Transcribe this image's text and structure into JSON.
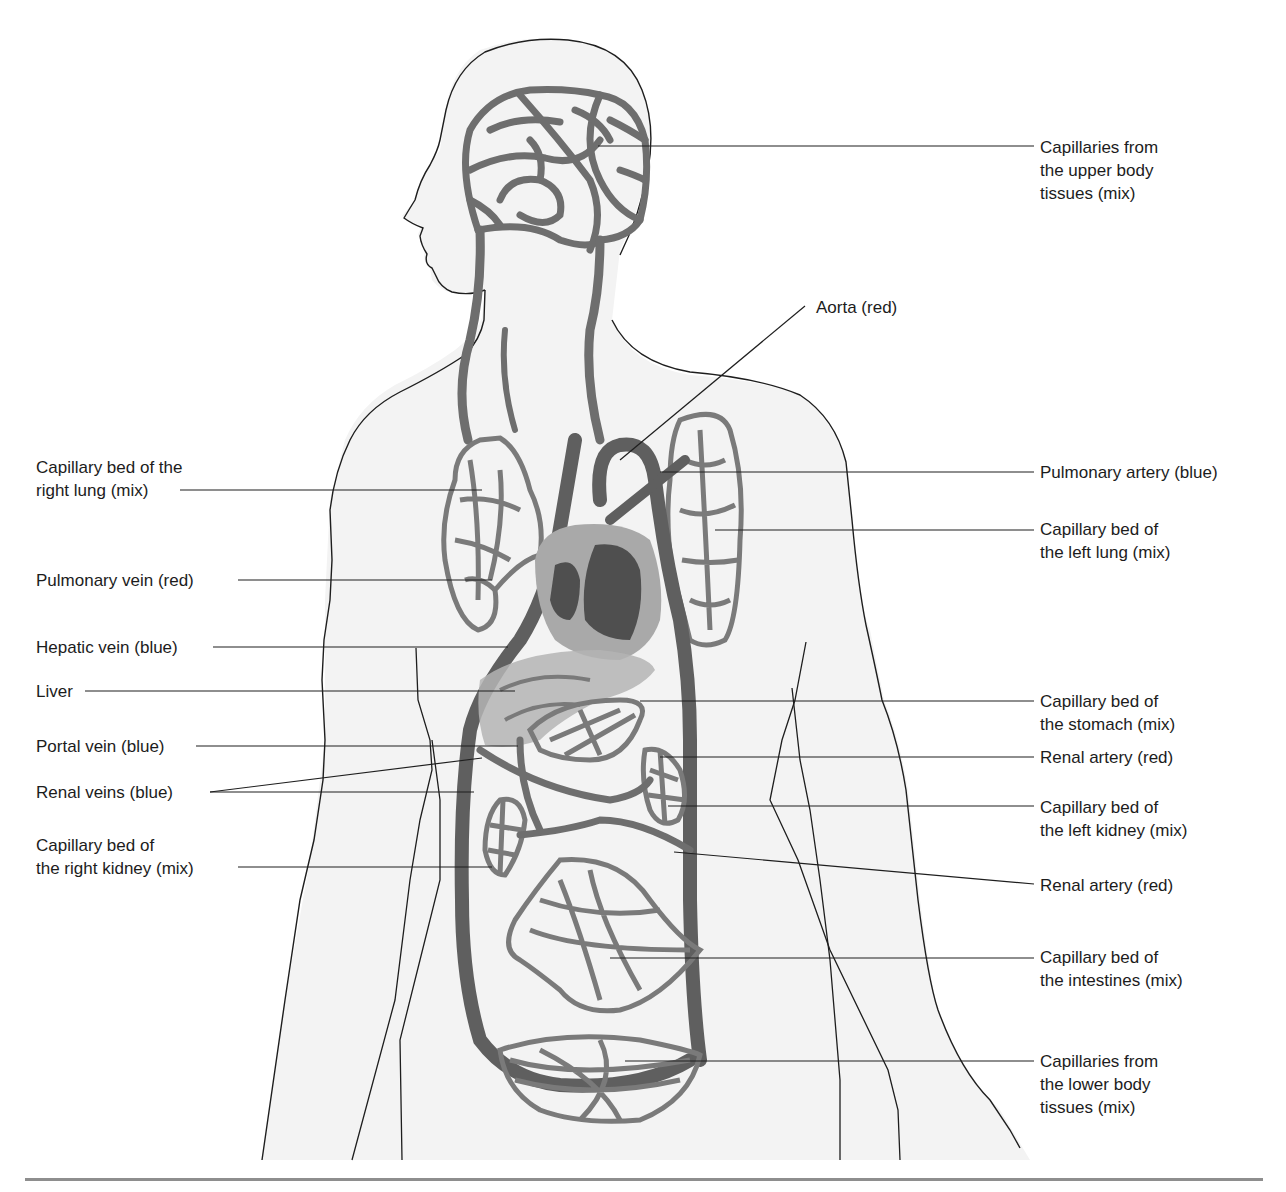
{
  "diagram": {
    "colors": {
      "body_fill": "#f3f3f3",
      "outline": "#1e1e1e",
      "vessel": "#6e6e6e",
      "vessel_dark": "#5a5a5a",
      "heart_outer": "#a9a9a9",
      "heart_inner": "#4f4f4f",
      "liver": "#b4b4b4",
      "leader": "#1e1e1e",
      "footer_rule": "#8e8e8e"
    },
    "labels_left": [
      {
        "id": "capillary-bed-right-lung",
        "text": "Capillary bed of the\nright lung (mix)"
      },
      {
        "id": "pulmonary-vein",
        "text": "Pulmonary vein (red)"
      },
      {
        "id": "hepatic-vein",
        "text": "Hepatic vein (blue)"
      },
      {
        "id": "liver",
        "text": "Liver"
      },
      {
        "id": "portal-vein",
        "text": "Portal vein (blue)"
      },
      {
        "id": "renal-veins",
        "text": "Renal veins (blue)"
      },
      {
        "id": "capillary-bed-right-kidney",
        "text": "Capillary bed of\nthe right kidney (mix)"
      }
    ],
    "labels_right": [
      {
        "id": "capillaries-upper-body",
        "text": "Capillaries from\nthe upper body\ntissues (mix)"
      },
      {
        "id": "aorta",
        "text": "Aorta (red)"
      },
      {
        "id": "pulmonary-artery",
        "text": "Pulmonary artery (blue)"
      },
      {
        "id": "capillary-bed-left-lung",
        "text": "Capillary bed of\nthe left lung (mix)"
      },
      {
        "id": "capillary-bed-stomach",
        "text": "Capillary bed of\nthe stomach (mix)"
      },
      {
        "id": "renal-artery-upper",
        "text": "Renal artery (red)"
      },
      {
        "id": "capillary-bed-left-kidney",
        "text": "Capillary bed of\nthe left kidney (mix)"
      },
      {
        "id": "renal-artery-lower",
        "text": "Renal artery (red)"
      },
      {
        "id": "capillary-bed-intestines",
        "text": "Capillary bed of\nthe intestines (mix)"
      },
      {
        "id": "capillaries-lower-body",
        "text": "Capillaries from\nthe lower body\ntissues (mix)"
      }
    ]
  }
}
